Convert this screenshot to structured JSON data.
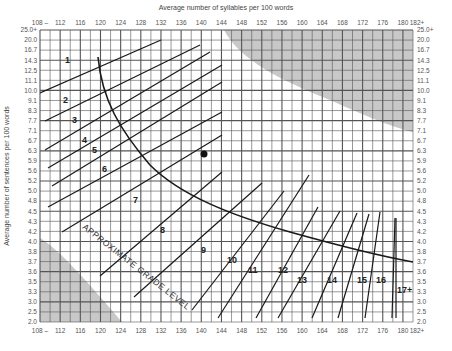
{
  "chart_data": {
    "type": "line",
    "xlabel": "Average number of syllables per 100 words",
    "ylabel": "Average number of sentences per 100 words",
    "x_ticks": [
      "108 –",
      "112",
      "116",
      "120",
      "124",
      "128",
      "132",
      "136",
      "140",
      "144",
      "148",
      "152",
      "156",
      "160",
      "164",
      "168",
      "172",
      "176",
      "180",
      "182+"
    ],
    "y_ticks": [
      "25.0+",
      "20.0",
      "16.7",
      "14.3",
      "12.5",
      "11.1",
      "10.0",
      "9.1",
      "8.3",
      "7.7",
      "7.1",
      "6.7",
      "6.3",
      "5.9",
      "5.6",
      "5.2",
      "5.0",
      "4.8",
      "4.5",
      "4.3",
      "4.2",
      "4.0",
      "3.8",
      "3.7",
      "3.6",
      "3.5",
      "3.3",
      "3.0",
      "2.5",
      "2.0"
    ],
    "xlim": [
      108,
      182
    ],
    "grid": true,
    "curve_label": "APPROXIMATE GRADE LEVEL",
    "grade_levels": [
      "1",
      "2",
      "3",
      "4",
      "5",
      "6",
      "7",
      "8",
      "9",
      "10",
      "11",
      "12",
      "13",
      "14",
      "15",
      "16",
      "17+"
    ],
    "sample_point": {
      "x": 141,
      "y": 6.3
    },
    "invalid_regions": [
      "upper-right shaded area",
      "lower-left shaded area"
    ]
  },
  "labels": {
    "top_axis_title": "Average number of syllables per 100 words",
    "left_axis_title": "Average number of sentences per 100 words",
    "curve_label": "APPROXIMATE GRADE LEVEL"
  }
}
